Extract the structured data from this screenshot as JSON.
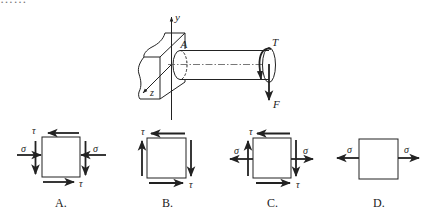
{
  "question": {
    "clipped_text": "……"
  },
  "main_figure": {
    "labels": {
      "y_axis": "y",
      "z_axis": "z",
      "point": "A",
      "torque": "T",
      "force": "F"
    }
  },
  "options": [
    {
      "letter": "A.",
      "sigma": "σ",
      "tau": "τ",
      "description": "compressive σ on left/right faces, τ top-left, bottom-right, both sides down"
    },
    {
      "letter": "B.",
      "sigma": "",
      "tau": "τ",
      "description": "pure shear: τ top-left, bottom-right, left up, right down"
    },
    {
      "letter": "C.",
      "sigma": "σ",
      "tau": "τ",
      "description": "tensile σ on left/right faces plus shear τ: top-left, bottom-right, left up, right down"
    },
    {
      "letter": "D.",
      "sigma": "σ",
      "tau": "",
      "description": "pure tensile σ on left/right faces"
    }
  ],
  "colors": {
    "ink": "#222222",
    "background": "#ffffff"
  }
}
